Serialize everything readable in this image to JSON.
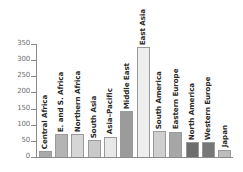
{
  "chart_data": {
    "type": "bar",
    "title": "",
    "subtitle": "",
    "xlabel": "",
    "ylabel": "",
    "ylim": [
      0,
      350
    ],
    "yticks": [
      0,
      50,
      100,
      150,
      200,
      250,
      300,
      350
    ],
    "grid": false,
    "legend": null,
    "orientation": "vertical",
    "label_rotation": -90,
    "categories": [
      "Central Africa",
      "E. and S. Africa",
      "Northern Africa",
      "South Asia",
      "Asia–Pacific",
      "Middle East",
      "East Asia",
      "South America",
      "Eastern Europe",
      "North America",
      "Western Europe",
      "Japan"
    ],
    "values": [
      18,
      70,
      72,
      52,
      63,
      143,
      340,
      80,
      79,
      47,
      45,
      23
    ],
    "bar_colors": [
      "#a9a9a9",
      "#b4b4b4",
      "#d6d6d6",
      "#c9c9c9",
      "#e8e8e8",
      "#9b9b9b",
      "#eeeeee",
      "#cfcfcf",
      "#a6a6a6",
      "#6e6e6e",
      "#777777",
      "#bdbdbd"
    ]
  },
  "axis": {
    "tick_color": "#8a8a8a",
    "tick_label_color": "#6f6f6f"
  }
}
